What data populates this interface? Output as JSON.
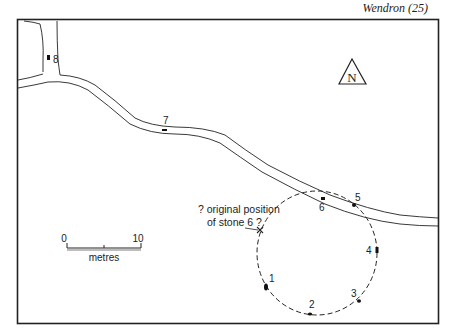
{
  "header": {
    "title": "Wendron (25)"
  },
  "map": {
    "north_label": "N",
    "scale": {
      "start": "0",
      "end": "10",
      "unit": "metres"
    },
    "annotation": {
      "line1": "? original position",
      "line2": "of stone 6 ?"
    },
    "stones": [
      {
        "id": "1",
        "label": "1"
      },
      {
        "id": "2",
        "label": "2"
      },
      {
        "id": "3",
        "label": "3"
      },
      {
        "id": "4",
        "label": "4"
      },
      {
        "id": "5",
        "label": "5"
      },
      {
        "id": "6",
        "label": "6"
      },
      {
        "id": "7",
        "label": "7"
      },
      {
        "id": "8",
        "label": "8"
      }
    ],
    "colors": {
      "ink": "#222222",
      "paper": "#ffffff"
    }
  }
}
